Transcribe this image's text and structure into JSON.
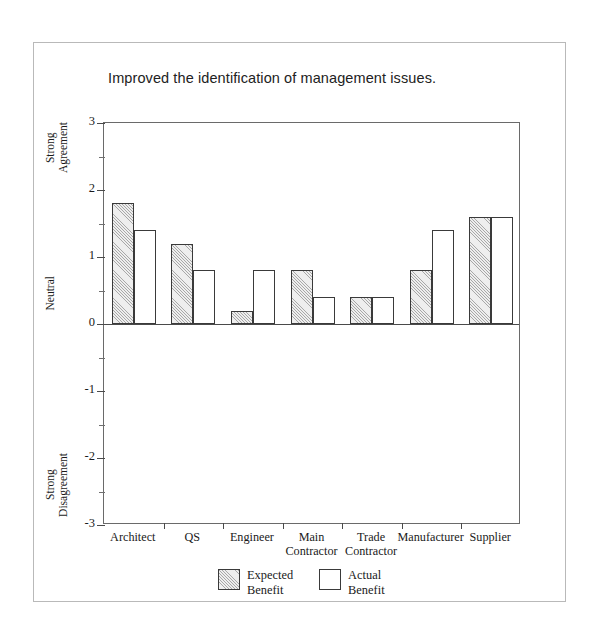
{
  "chart_data": {
    "type": "bar",
    "title": "Improved the identification of management issues.",
    "xlabel": "",
    "ylabel": "",
    "ylim": [
      -3,
      3
    ],
    "ytick_values": [
      3,
      2,
      1,
      0,
      -1,
      -2,
      -3
    ],
    "ytick_labels": [
      "3",
      "2",
      "1",
      "0",
      "-1",
      "-2",
      "-3"
    ],
    "yminor_step": 0.5,
    "grid": false,
    "legend_position": "bottom-center",
    "y_axis_descriptors": [
      {
        "label": "Strong\nAgreement",
        "value": 2.5
      },
      {
        "label": "Neutral",
        "value": 0.2
      },
      {
        "label": "Strong\nDisagreement",
        "value": -2.45
      }
    ],
    "categories": [
      "Architect",
      "QS",
      "Engineer",
      "Main\nContractor",
      "Trade\nContractor",
      "Manufacturer",
      "Supplier"
    ],
    "series": [
      {
        "name": "Expected\nBenefit",
        "legend_label": "Expected Benefit",
        "fill": "hatched",
        "values": [
          1.8,
          1.2,
          0.2,
          0.8,
          0.4,
          0.8,
          1.6
        ]
      },
      {
        "name": "Actual\nBenefit",
        "legend_label": "Actual Benefit",
        "fill": "white",
        "values": [
          1.4,
          0.8,
          0.8,
          0.4,
          0.4,
          1.4,
          1.6
        ]
      }
    ]
  },
  "colors": {
    "bar_outline": "#3a3a3a",
    "hatch": "#6e6e6e",
    "axis": "#4a4a4a",
    "plot_border": "#6a6a6a",
    "page_border": "#b9b9b9",
    "text": "#1a1a1a",
    "background": "#ffffff"
  }
}
